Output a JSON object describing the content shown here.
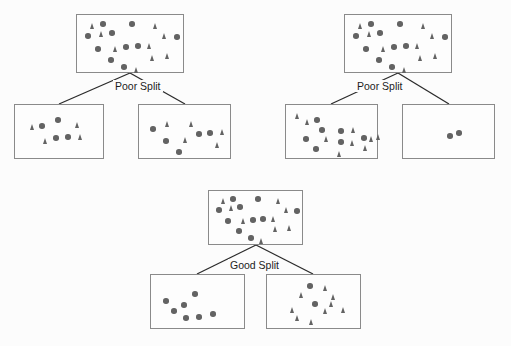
{
  "figure": {
    "background_color": "#fcfcfc",
    "width": 511,
    "height": 346,
    "marker_color": "#636363",
    "box_border_color": "#8a8a8a",
    "edge_color": "#2b2b2b",
    "label_color": "#1d1d1d"
  },
  "trees": [
    {
      "id": "tree-poor-split-left",
      "label": "Poor Split",
      "label_pos": {
        "x": 113,
        "y": 80
      },
      "root": {
        "id": "root-1",
        "box": {
          "x": 76,
          "y": 14,
          "w": 108,
          "h": 59
        },
        "markers": [
          {
            "type": "triangle",
            "x": 13,
            "y": 8
          },
          {
            "type": "circle",
            "x": 23,
            "y": 6
          },
          {
            "type": "circle",
            "x": 52,
            "y": 6
          },
          {
            "type": "triangle",
            "x": 76,
            "y": 8
          },
          {
            "type": "circle",
            "x": 8,
            "y": 18
          },
          {
            "type": "triangle",
            "x": 22,
            "y": 16
          },
          {
            "type": "circle",
            "x": 32,
            "y": 15
          },
          {
            "type": "triangle",
            "x": 85,
            "y": 18
          },
          {
            "type": "circle",
            "x": 97,
            "y": 19
          },
          {
            "type": "circle",
            "x": 18,
            "y": 31
          },
          {
            "type": "triangle",
            "x": 36,
            "y": 31
          },
          {
            "type": "circle",
            "x": 46,
            "y": 29
          },
          {
            "type": "circle",
            "x": 58,
            "y": 28
          },
          {
            "type": "triangle",
            "x": 70,
            "y": 28
          },
          {
            "type": "circle",
            "x": 31,
            "y": 42
          },
          {
            "type": "triangle",
            "x": 73,
            "y": 40
          },
          {
            "type": "triangle",
            "x": 88,
            "y": 38
          },
          {
            "type": "circle",
            "x": 44,
            "y": 49
          },
          {
            "type": "triangle",
            "x": 57,
            "y": 52
          }
        ]
      },
      "children": [
        {
          "id": "child-1-left",
          "box": {
            "x": 14,
            "y": 104,
            "w": 90,
            "h": 55
          },
          "markers": [
            {
              "type": "circle",
              "x": 40,
              "y": 12
            },
            {
              "type": "triangle",
              "x": 15,
              "y": 19
            },
            {
              "type": "circle",
              "x": 24,
              "y": 18
            },
            {
              "type": "triangle",
              "x": 60,
              "y": 17
            },
            {
              "type": "triangle",
              "x": 28,
              "y": 33
            },
            {
              "type": "circle",
              "x": 38,
              "y": 30
            },
            {
              "type": "circle",
              "x": 50,
              "y": 29
            },
            {
              "type": "triangle",
              "x": 63,
              "y": 29
            }
          ]
        },
        {
          "id": "child-1-right",
          "box": {
            "x": 138,
            "y": 104,
            "w": 93,
            "h": 55
          },
          "markers": [
            {
              "type": "triangle",
              "x": 26,
              "y": 16
            },
            {
              "type": "circle",
              "x": 11,
              "y": 21
            },
            {
              "type": "triangle",
              "x": 50,
              "y": 16
            },
            {
              "type": "circle",
              "x": 57,
              "y": 26
            },
            {
              "type": "circle",
              "x": 68,
              "y": 25
            },
            {
              "type": "triangle",
              "x": 81,
              "y": 24
            },
            {
              "type": "circle",
              "x": 24,
              "y": 33
            },
            {
              "type": "triangle",
              "x": 44,
              "y": 32
            },
            {
              "type": "triangle",
              "x": 76,
              "y": 37
            },
            {
              "type": "circle",
              "x": 37,
              "y": 44
            }
          ]
        }
      ]
    },
    {
      "id": "tree-poor-split-right",
      "label": "Poor Split",
      "label_pos": {
        "x": 355,
        "y": 80
      },
      "root": {
        "id": "root-2",
        "box": {
          "x": 344,
          "y": 14,
          "w": 108,
          "h": 59
        },
        "markers": [
          {
            "type": "triangle",
            "x": 13,
            "y": 8
          },
          {
            "type": "circle",
            "x": 23,
            "y": 6
          },
          {
            "type": "circle",
            "x": 52,
            "y": 6
          },
          {
            "type": "triangle",
            "x": 76,
            "y": 8
          },
          {
            "type": "circle",
            "x": 8,
            "y": 18
          },
          {
            "type": "triangle",
            "x": 22,
            "y": 16
          },
          {
            "type": "circle",
            "x": 32,
            "y": 15
          },
          {
            "type": "triangle",
            "x": 85,
            "y": 18
          },
          {
            "type": "circle",
            "x": 97,
            "y": 19
          },
          {
            "type": "circle",
            "x": 18,
            "y": 31
          },
          {
            "type": "triangle",
            "x": 36,
            "y": 31
          },
          {
            "type": "circle",
            "x": 46,
            "y": 29
          },
          {
            "type": "circle",
            "x": 58,
            "y": 28
          },
          {
            "type": "triangle",
            "x": 70,
            "y": 28
          },
          {
            "type": "circle",
            "x": 31,
            "y": 42
          },
          {
            "type": "triangle",
            "x": 73,
            "y": 40
          },
          {
            "type": "triangle",
            "x": 88,
            "y": 38
          },
          {
            "type": "circle",
            "x": 44,
            "y": 49
          },
          {
            "type": "triangle",
            "x": 57,
            "y": 52
          }
        ]
      },
      "children": [
        {
          "id": "child-2-left",
          "box": {
            "x": 285,
            "y": 104,
            "w": 93,
            "h": 55
          },
          "markers": [
            {
              "type": "triangle",
              "x": 9,
              "y": 8
            },
            {
              "type": "triangle",
              "x": 19,
              "y": 14
            },
            {
              "type": "circle",
              "x": 28,
              "y": 12
            },
            {
              "type": "circle",
              "x": 33,
              "y": 22
            },
            {
              "type": "circle",
              "x": 52,
              "y": 23
            },
            {
              "type": "triangle",
              "x": 65,
              "y": 22
            },
            {
              "type": "circle",
              "x": 17,
              "y": 31
            },
            {
              "type": "triangle",
              "x": 38,
              "y": 31
            },
            {
              "type": "circle",
              "x": 52,
              "y": 34
            },
            {
              "type": "triangle",
              "x": 64,
              "y": 35
            },
            {
              "type": "circle",
              "x": 75,
              "y": 30
            },
            {
              "type": "triangle",
              "x": 83,
              "y": 31
            },
            {
              "type": "triangle",
              "x": 90,
              "y": 29
            },
            {
              "type": "circle",
              "x": 27,
              "y": 41
            },
            {
              "type": "triangle",
              "x": 77,
              "y": 40
            },
            {
              "type": "triangle",
              "x": 51,
              "y": 46
            }
          ]
        },
        {
          "id": "child-2-right",
          "box": {
            "x": 402,
            "y": 104,
            "w": 93,
            "h": 55
          },
          "markers": [
            {
              "type": "circle",
              "x": 44,
              "y": 28
            },
            {
              "type": "circle",
              "x": 53,
              "y": 25
            }
          ]
        }
      ]
    },
    {
      "id": "tree-good-split",
      "label": "Good Split",
      "label_pos": {
        "x": 228,
        "y": 259
      },
      "root": {
        "id": "root-3",
        "box": {
          "x": 208,
          "y": 190,
          "w": 95,
          "h": 55
        },
        "markers": [
          {
            "type": "triangle",
            "x": 12,
            "y": 7
          },
          {
            "type": "circle",
            "x": 21,
            "y": 5
          },
          {
            "type": "circle",
            "x": 46,
            "y": 5
          },
          {
            "type": "triangle",
            "x": 67,
            "y": 7
          },
          {
            "type": "circle",
            "x": 7,
            "y": 16
          },
          {
            "type": "triangle",
            "x": 20,
            "y": 14
          },
          {
            "type": "circle",
            "x": 28,
            "y": 13
          },
          {
            "type": "triangle",
            "x": 75,
            "y": 16
          },
          {
            "type": "circle",
            "x": 85,
            "y": 17
          },
          {
            "type": "circle",
            "x": 16,
            "y": 27
          },
          {
            "type": "triangle",
            "x": 32,
            "y": 27
          },
          {
            "type": "circle",
            "x": 41,
            "y": 26
          },
          {
            "type": "circle",
            "x": 51,
            "y": 25
          },
          {
            "type": "triangle",
            "x": 62,
            "y": 25
          },
          {
            "type": "circle",
            "x": 27,
            "y": 37
          },
          {
            "type": "triangle",
            "x": 64,
            "y": 35
          },
          {
            "type": "triangle",
            "x": 78,
            "y": 34
          },
          {
            "type": "circle",
            "x": 39,
            "y": 44
          },
          {
            "type": "triangle",
            "x": 50,
            "y": 47
          }
        ]
      },
      "children": [
        {
          "id": "child-3-left",
          "box": {
            "x": 150,
            "y": 274,
            "w": 95,
            "h": 55
          },
          "markers": [
            {
              "type": "circle",
              "x": 41,
              "y": 16
            },
            {
              "type": "circle",
              "x": 12,
              "y": 23
            },
            {
              "type": "circle",
              "x": 30,
              "y": 27
            },
            {
              "type": "circle",
              "x": 20,
              "y": 33
            },
            {
              "type": "circle",
              "x": 32,
              "y": 40
            },
            {
              "type": "circle",
              "x": 45,
              "y": 39
            },
            {
              "type": "circle",
              "x": 59,
              "y": 36
            }
          ]
        },
        {
          "id": "child-3-right",
          "box": {
            "x": 266,
            "y": 274,
            "w": 95,
            "h": 55
          },
          "markers": [
            {
              "type": "circle",
              "x": 40,
              "y": 8
            },
            {
              "type": "triangle",
              "x": 56,
              "y": 10
            },
            {
              "type": "triangle",
              "x": 32,
              "y": 17
            },
            {
              "type": "triangle",
              "x": 64,
              "y": 19
            },
            {
              "type": "circle",
              "x": 45,
              "y": 26
            },
            {
              "type": "triangle",
              "x": 62,
              "y": 26
            },
            {
              "type": "triangle",
              "x": 23,
              "y": 32
            },
            {
              "type": "triangle",
              "x": 56,
              "y": 33
            },
            {
              "type": "triangle",
              "x": 74,
              "y": 32
            },
            {
              "type": "triangle",
              "x": 28,
              "y": 40
            },
            {
              "type": "triangle",
              "x": 42,
              "y": 44
            }
          ]
        }
      ]
    }
  ],
  "edges": [
    {
      "id": "edge-1-left",
      "x1": 130,
      "y1": 73,
      "x2": 59,
      "y2": 104
    },
    {
      "id": "edge-1-right",
      "x1": 130,
      "y1": 73,
      "x2": 185,
      "y2": 104
    },
    {
      "id": "edge-2-left",
      "x1": 398,
      "y1": 73,
      "x2": 331,
      "y2": 104
    },
    {
      "id": "edge-2-right",
      "x1": 398,
      "y1": 73,
      "x2": 449,
      "y2": 104
    },
    {
      "id": "edge-3-left",
      "x1": 256,
      "y1": 245,
      "x2": 197,
      "y2": 274
    },
    {
      "id": "edge-3-right",
      "x1": 256,
      "y1": 245,
      "x2": 313,
      "y2": 274
    }
  ]
}
